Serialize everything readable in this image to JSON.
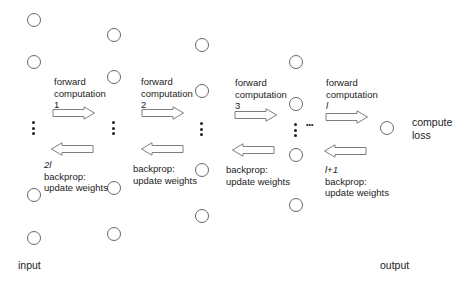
{
  "diagram": {
    "title": "",
    "labels": {
      "input": "input",
      "output": "output",
      "compute_loss_line1": "compute",
      "compute_loss_line2": "loss"
    },
    "forward_steps": [
      {
        "line1": "forward",
        "line2": "computation",
        "step": "1"
      },
      {
        "line1": "forward",
        "line2": "computation",
        "step": "2"
      },
      {
        "line1": "forward",
        "line2": "computation",
        "step": "3"
      },
      {
        "line1": "forward",
        "line2": "computation",
        "step": "l"
      }
    ],
    "backward_steps": [
      {
        "step": "2l",
        "line1": "backprop:",
        "line2": "update weights"
      },
      {
        "step": "",
        "line1": "backprop:",
        "line2": "update weights"
      },
      {
        "step": "",
        "line1": "backprop:",
        "line2": "update weights"
      },
      {
        "step": "l+1",
        "line1": "backprop:",
        "line2": "update weights"
      }
    ],
    "ellipsis": "•••",
    "colors": {
      "node_stroke": "#666666",
      "arrow_stroke": "#7f7f7f",
      "text": "#222222"
    }
  }
}
